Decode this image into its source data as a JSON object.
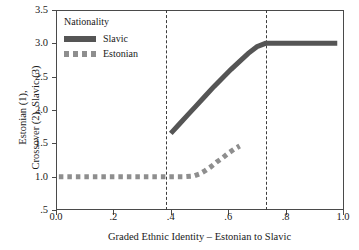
{
  "axes": {
    "y_label_line1": "Estonian (1),",
    "y_label_line2": "Crossover (2), Slavic (3)",
    "x_label": "Graded Ethnic Identity – Estonian to Slavic",
    "y_ticks": [
      "3.5",
      "3.0",
      "2.5",
      "2.0",
      "1.5",
      "1.0",
      ".5"
    ],
    "x_ticks": [
      "0.0",
      ".2",
      ".4",
      ".6",
      ".8",
      "1.0"
    ]
  },
  "legend": {
    "title": "Nationality",
    "items": [
      {
        "label": "Slavic",
        "style": "solid",
        "color": "#555555"
      },
      {
        "label": "Estonian",
        "style": "dotted",
        "color": "#8e8e8e"
      }
    ]
  },
  "chart_data": {
    "type": "line",
    "title": "",
    "xlabel": "Graded Ethnic Identity – Estonian to Slavic",
    "ylabel": "Estonian (1), Crossover (2), Slavic (3)",
    "xlim": [
      0.0,
      1.0
    ],
    "ylim": [
      0.5,
      3.5
    ],
    "grid": false,
    "legend_position": "top-left-inside",
    "reference_lines": [
      {
        "type": "vertical",
        "x": 0.385,
        "style": "dashed",
        "color": "#3d3d3d"
      },
      {
        "type": "vertical",
        "x": 0.73,
        "style": "dashed",
        "color": "#3d3d3d"
      }
    ],
    "series": [
      {
        "name": "Slavic",
        "style": "solid",
        "color": "#555555",
        "linewidth": 5,
        "x": [
          0.4,
          0.43,
          0.46,
          0.49,
          0.52,
          0.55,
          0.58,
          0.61,
          0.64,
          0.67,
          0.7,
          0.73,
          0.76,
          0.8,
          0.85,
          0.9,
          0.95,
          0.98
        ],
        "y": [
          1.65,
          1.79,
          1.93,
          2.07,
          2.21,
          2.35,
          2.48,
          2.61,
          2.73,
          2.85,
          2.95,
          3.0,
          3.0,
          3.0,
          3.0,
          3.0,
          3.0,
          3.0
        ]
      },
      {
        "name": "Estonian",
        "style": "dotted",
        "color": "#8e8e8e",
        "linewidth": 5,
        "x": [
          0.01,
          0.06,
          0.11,
          0.16,
          0.21,
          0.26,
          0.31,
          0.36,
          0.41,
          0.45,
          0.48,
          0.5,
          0.52,
          0.54,
          0.56,
          0.58,
          0.6,
          0.62,
          0.64
        ],
        "y": [
          1.0,
          1.0,
          1.0,
          1.0,
          1.0,
          1.0,
          1.0,
          1.0,
          1.0,
          1.0,
          1.01,
          1.04,
          1.09,
          1.15,
          1.22,
          1.28,
          1.35,
          1.41,
          1.46
        ]
      }
    ]
  }
}
